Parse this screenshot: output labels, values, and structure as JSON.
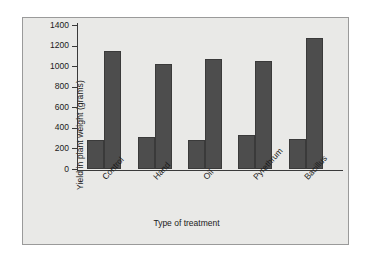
{
  "chart_data": {
    "type": "bar",
    "title": "",
    "subtitle": "",
    "xlabel": "Type of treatment",
    "ylabel": "Yield in plant weight (grams)",
    "categories": [
      "Control",
      "Hand",
      "Oil",
      "Pyrethrum",
      "Bacillus"
    ],
    "series": [
      {
        "name": "series-1",
        "values": [
          285,
          310,
          285,
          330,
          290
        ]
      },
      {
        "name": "series-2",
        "values": [
          1145,
          1020,
          1065,
          1050,
          1270
        ]
      }
    ],
    "ylim": [
      0,
      1400
    ],
    "ytick_labels": [
      "0",
      "200",
      "400",
      "600",
      "800",
      "1000",
      "1200",
      "1400"
    ],
    "ytick_values": [
      0,
      200,
      400,
      600,
      800,
      1000,
      1200,
      1400
    ],
    "grid": false,
    "legend": "none",
    "bar_color": "#4d4d4d",
    "panel_background": "#e9e9e7",
    "axis_color": "#3a3a3a",
    "frame_color": "#9a9a9a"
  }
}
